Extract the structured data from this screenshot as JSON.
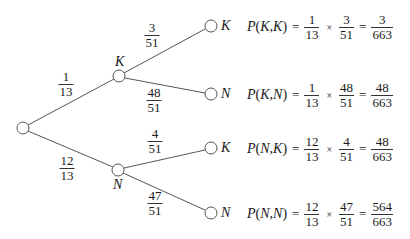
{
  "colors": {
    "line": "#555555",
    "text": "#1a1a1a",
    "background": "#ffffff"
  },
  "tree": {
    "root": {
      "cx": 23,
      "cy": 128
    },
    "level1": [
      {
        "id": "K",
        "label": "K",
        "cx": 119,
        "cy": 76,
        "prob_num": "1",
        "prob_den": "13"
      },
      {
        "id": "N",
        "label": "N",
        "cx": 118,
        "cy": 170,
        "prob_num": "12",
        "prob_den": "13"
      }
    ],
    "level2": [
      {
        "id": "KK",
        "parent": "K",
        "label": "K",
        "cx": 211,
        "cy": 26,
        "prob_num": "3",
        "prob_den": "51"
      },
      {
        "id": "KN",
        "parent": "K",
        "label": "N",
        "cx": 211,
        "cy": 94,
        "prob_num": "48",
        "prob_den": "51"
      },
      {
        "id": "NK",
        "parent": "N",
        "label": "K",
        "cx": 211,
        "cy": 148,
        "prob_num": "4",
        "prob_den": "51"
      },
      {
        "id": "NN",
        "parent": "N",
        "label": "N",
        "cx": 211,
        "cy": 213,
        "prob_num": "47",
        "prob_den": "51"
      }
    ]
  },
  "equations": [
    {
      "lhs_p": "P",
      "lhs_args": "K,K",
      "f1_num": "1",
      "f1_den": "13",
      "times": "×",
      "f2_num": "3",
      "f2_den": "51",
      "eq": "=",
      "res_num": "3",
      "res_den": "663"
    },
    {
      "lhs_p": "P",
      "lhs_args": "K,N",
      "f1_num": "1",
      "f1_den": "13",
      "times": "×",
      "f2_num": "48",
      "f2_den": "51",
      "eq": "=",
      "res_num": "48",
      "res_den": "663"
    },
    {
      "lhs_p": "P",
      "lhs_args": "N,K",
      "f1_num": "12",
      "f1_den": "13",
      "times": "×",
      "f2_num": "4",
      "f2_den": "51",
      "eq": "=",
      "res_num": "48",
      "res_den": "663"
    },
    {
      "lhs_p": "P",
      "lhs_args": "N,N",
      "f1_num": "12",
      "f1_den": "13",
      "times": "×",
      "f2_num": "47",
      "f2_den": "51",
      "eq": "=",
      "res_num": "564",
      "res_den": "663"
    }
  ]
}
